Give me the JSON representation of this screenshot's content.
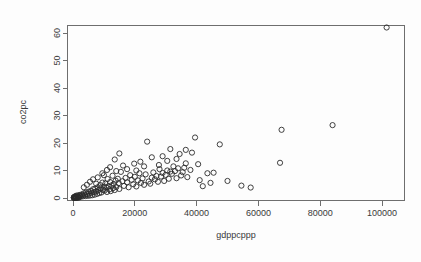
{
  "chart_data": {
    "type": "scatter",
    "title": "",
    "xlabel": "gdppcppp",
    "ylabel": "co2pc",
    "xlim": [
      -3000,
      108000
    ],
    "ylim": [
      -2.5,
      65
    ],
    "grid": false,
    "legend": null,
    "marker": "open-circle",
    "xticks": [
      0,
      20000,
      40000,
      60000,
      80000,
      100000
    ],
    "xtick_labels": [
      "0",
      "20000",
      "40000",
      "60000",
      "80000",
      "100000"
    ],
    "yticks": [
      0,
      10,
      20,
      30,
      40,
      50,
      60
    ],
    "ytick_labels": [
      "0",
      "10",
      "20",
      "30",
      "40",
      "50",
      "60"
    ],
    "points": [
      [
        101500,
        62.0
      ],
      [
        84000,
        26.5
      ],
      [
        67500,
        24.8
      ],
      [
        67000,
        12.8
      ],
      [
        57500,
        3.8
      ],
      [
        54500,
        4.5
      ],
      [
        47500,
        19.5
      ],
      [
        45500,
        9.2
      ],
      [
        43500,
        9.0
      ],
      [
        41000,
        6.5
      ],
      [
        40500,
        12.3
      ],
      [
        39500,
        22.0
      ],
      [
        38500,
        16.5
      ],
      [
        38000,
        10.2
      ],
      [
        37000,
        7.6
      ],
      [
        36500,
        17.5
      ],
      [
        36000,
        11.0
      ],
      [
        35500,
        9.4
      ],
      [
        35000,
        8.2
      ],
      [
        34500,
        16.0
      ],
      [
        34000,
        10.8
      ],
      [
        33500,
        7.2
      ],
      [
        33000,
        9.8
      ],
      [
        32500,
        11.5
      ],
      [
        32000,
        8.8
      ],
      [
        31500,
        9.6
      ],
      [
        31000,
        7.0
      ],
      [
        30500,
        10.0
      ],
      [
        30000,
        8.4
      ],
      [
        29500,
        6.2
      ],
      [
        29000,
        9.1
      ],
      [
        28500,
        7.8
      ],
      [
        28000,
        10.5
      ],
      [
        27500,
        5.9
      ],
      [
        27000,
        8.0
      ],
      [
        26500,
        6.8
      ],
      [
        26000,
        9.3
      ],
      [
        25500,
        7.4
      ],
      [
        25000,
        5.2
      ],
      [
        24500,
        6.0
      ],
      [
        24000,
        20.5
      ],
      [
        23500,
        8.6
      ],
      [
        23000,
        4.8
      ],
      [
        22500,
        7.1
      ],
      [
        22000,
        5.5
      ],
      [
        21500,
        9.0
      ],
      [
        21000,
        6.4
      ],
      [
        20500,
        4.2
      ],
      [
        20000,
        7.7
      ],
      [
        19500,
        5.0
      ],
      [
        19000,
        6.6
      ],
      [
        18500,
        8.3
      ],
      [
        18000,
        3.9
      ],
      [
        17500,
        5.7
      ],
      [
        17000,
        7.3
      ],
      [
        16500,
        4.4
      ],
      [
        16000,
        6.1
      ],
      [
        15500,
        9.5
      ],
      [
        15000,
        3.3
      ],
      [
        14800,
        5.4
      ],
      [
        14500,
        7.0
      ],
      [
        14000,
        4.0
      ],
      [
        13800,
        6.3
      ],
      [
        13500,
        2.9
      ],
      [
        13200,
        5.1
      ],
      [
        13000,
        3.6
      ],
      [
        12800,
        8.1
      ],
      [
        12500,
        4.6
      ],
      [
        12200,
        2.5
      ],
      [
        12000,
        5.8
      ],
      [
        11800,
        3.1
      ],
      [
        11500,
        4.3
      ],
      [
        11200,
        6.9
      ],
      [
        11000,
        2.2
      ],
      [
        10800,
        3.8
      ],
      [
        10500,
        5.3
      ],
      [
        10200,
        2.7
      ],
      [
        10000,
        4.1
      ],
      [
        9800,
        3.0
      ],
      [
        9500,
        5.6
      ],
      [
        9200,
        2.0
      ],
      [
        9000,
        3.5
      ],
      [
        8800,
        4.7
      ],
      [
        8500,
        1.8
      ],
      [
        8200,
        2.8
      ],
      [
        8000,
        3.9
      ],
      [
        7800,
        1.5
      ],
      [
        7500,
        2.4
      ],
      [
        7200,
        3.4
      ],
      [
        7000,
        1.2
      ],
      [
        6800,
        2.1
      ],
      [
        6500,
        3.2
      ],
      [
        6200,
        1.0
      ],
      [
        6000,
        1.9
      ],
      [
        5800,
        2.6
      ],
      [
        5500,
        0.9
      ],
      [
        5200,
        1.6
      ],
      [
        5000,
        2.3
      ],
      [
        4800,
        0.8
      ],
      [
        4500,
        1.4
      ],
      [
        4200,
        2.0
      ],
      [
        4000,
        0.7
      ],
      [
        3800,
        1.1
      ],
      [
        3500,
        1.7
      ],
      [
        3200,
        0.6
      ],
      [
        3000,
        1.0
      ],
      [
        2800,
        1.3
      ],
      [
        2500,
        0.5
      ],
      [
        2200,
        0.8
      ],
      [
        2000,
        1.1
      ],
      [
        1800,
        0.4
      ],
      [
        1500,
        0.6
      ],
      [
        1200,
        0.9
      ],
      [
        1000,
        0.3
      ],
      [
        900,
        0.5
      ],
      [
        800,
        0.7
      ],
      [
        700,
        0.25
      ],
      [
        600,
        0.4
      ],
      [
        500,
        0.2
      ],
      [
        450,
        0.35
      ],
      [
        400,
        0.15
      ],
      [
        350,
        0.3
      ],
      [
        300,
        0.12
      ],
      [
        280,
        0.25
      ],
      [
        250,
        0.1
      ],
      [
        13500,
        14.0
      ],
      [
        16200,
        11.8
      ],
      [
        19800,
        12.5
      ],
      [
        21800,
        13.2
      ],
      [
        25500,
        14.8
      ],
      [
        27800,
        12.0
      ],
      [
        30500,
        13.5
      ],
      [
        33500,
        14.2
      ],
      [
        36500,
        12.6
      ],
      [
        9500,
        9.0
      ],
      [
        11000,
        10.2
      ],
      [
        8000,
        7.5
      ],
      [
        6500,
        6.8
      ],
      [
        5500,
        5.9
      ],
      [
        4500,
        4.8
      ],
      [
        3500,
        3.9
      ],
      [
        14000,
        9.8
      ],
      [
        17500,
        10.5
      ],
      [
        12000,
        11.2
      ],
      [
        10000,
        8.3
      ],
      [
        7500,
        5.2
      ],
      [
        23000,
        11.5
      ],
      [
        20500,
        10.0
      ],
      [
        42000,
        4.3
      ],
      [
        44500,
        5.5
      ],
      [
        50000,
        6.2
      ],
      [
        15000,
        16.2
      ],
      [
        31500,
        17.8
      ],
      [
        29000,
        15.2
      ],
      [
        2000,
        0.2
      ],
      [
        1600,
        0.15
      ],
      [
        1300,
        0.1
      ],
      [
        1100,
        0.18
      ],
      [
        950,
        0.12
      ],
      [
        750,
        0.08
      ],
      [
        550,
        0.1
      ],
      [
        380,
        0.06
      ]
    ]
  }
}
